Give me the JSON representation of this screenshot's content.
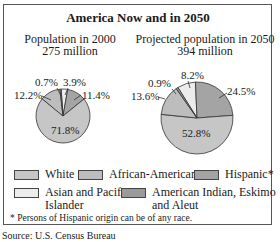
{
  "chart_data": [
    {
      "type": "pie",
      "title": "Population in 2000",
      "subtitle": "275 million",
      "categories": [
        "White",
        "African-American",
        "Hispanic*",
        "Asian and Pacific Islander",
        "American Indian, Eskimo and Aleut"
      ],
      "values": [
        71.8,
        12.2,
        11.4,
        3.9,
        0.7
      ],
      "labels": [
        "71.8%",
        "12.2%",
        "11.4%",
        "3.9%",
        "0.7%"
      ]
    },
    {
      "type": "pie",
      "title": "Projected population in 2050",
      "subtitle": "394 million",
      "categories": [
        "White",
        "African-American",
        "Hispanic*",
        "Asian and Pacific Islander",
        "American Indian, Eskimo and Aleut"
      ],
      "values": [
        52.8,
        13.6,
        24.5,
        8.2,
        0.9
      ],
      "labels": [
        "52.8%",
        "13.6%",
        "24.5%",
        "8.2%",
        "0.9%"
      ]
    }
  ],
  "figure": {
    "title": "America Now and in 2050",
    "left": {
      "line1": "Population in 2000",
      "line2": "275 million"
    },
    "right": {
      "line1": "Projected population in 2050",
      "line2": "394 million"
    }
  },
  "colors": {
    "white": "#c6c6c6",
    "african_american": "#bdbdbd",
    "hispanic": "#a4a4a4",
    "asian": "#ececec",
    "american_indian": "#9a9a9a"
  },
  "legend": {
    "white": "White",
    "african_american": "African-American",
    "hispanic": "Hispanic*",
    "asian_line1": "Asian and Pacific",
    "asian_line2": "Islander",
    "indian_line1": "American Indian, Eskimo",
    "indian_line2": "and Aleut"
  },
  "footnote": "* Persons of Hispanic origin can be of any race.",
  "source": "Source: U.S. Census Bureau"
}
